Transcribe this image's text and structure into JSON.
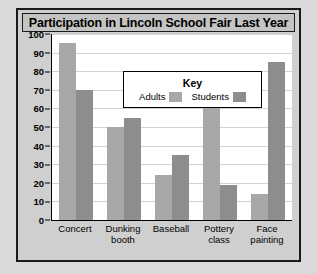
{
  "chart_data": {
    "type": "bar",
    "title": "Participation in Lincoln School Fair Last Year",
    "xlabel": "",
    "ylabel": "",
    "ylim": [
      0,
      100
    ],
    "ytick_step": 10,
    "yticks": [
      0,
      10,
      20,
      30,
      40,
      50,
      60,
      70,
      80,
      90,
      100
    ],
    "grid": true,
    "legend_position": "inside-top-center",
    "legend_title": "Key",
    "categories": [
      "Concert",
      "Dunking booth",
      "Baseball",
      "Pottery class",
      "Face painting"
    ],
    "series": [
      {
        "name": "Adults",
        "color": "#a8a8a8",
        "values": [
          95,
          50,
          24,
          64,
          14
        ]
      },
      {
        "name": "Students",
        "color": "#8d8d8d",
        "values": [
          70,
          55,
          35,
          19,
          85
        ]
      }
    ]
  },
  "colors": {
    "page_background": "#d9d9d9",
    "panel_background": "#cfcfcf",
    "plot_background": "#ffffff",
    "gridline": "#d2d2d2",
    "axis": "#000000",
    "title_banner": "#c4c4c4"
  }
}
